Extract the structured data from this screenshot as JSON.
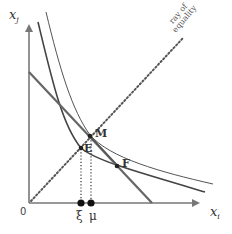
{
  "diagram": {
    "type": "economics-indifference-diagram",
    "axes": {
      "y_label": "x",
      "y_label_sub": "j",
      "x_label": "x",
      "x_label_sub": "i",
      "origin_label": "0"
    },
    "ray": {
      "label_line1": "ray of",
      "label_line2": "equality"
    },
    "points": {
      "M": "M",
      "E": "E",
      "F": "F"
    },
    "axis_marks": {
      "xi": "ξ",
      "mu": "μ"
    },
    "colors": {
      "axis": "#777777",
      "budget_line": "#666666",
      "curve_dark": "#444444",
      "curve_thin": "#555555",
      "ray": "#555555",
      "marker": "#111111"
    }
  }
}
